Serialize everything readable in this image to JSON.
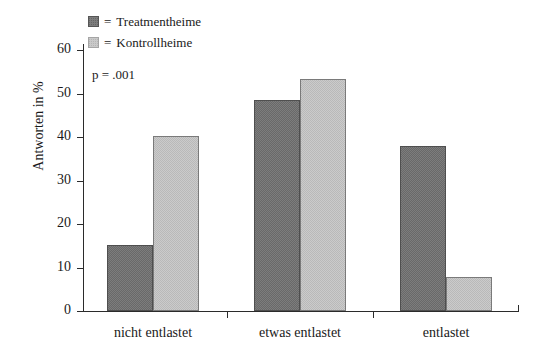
{
  "chart_data": {
    "type": "bar",
    "title": "",
    "xlabel": "",
    "ylabel": "Antworten in %",
    "ylim": [
      0,
      60
    ],
    "yticks": [
      0,
      10,
      20,
      30,
      40,
      50,
      60
    ],
    "grid": false,
    "legend_position": "top-left",
    "categories": [
      "nicht entlastet",
      "etwas entlastet",
      "entlastet"
    ],
    "series": [
      {
        "name": "Treatmentheime",
        "color": "#7d7d7d",
        "values": [
          15.1,
          48.5,
          37.9
        ]
      },
      {
        "name": "Kontrollheime",
        "color": "#cbcbcb",
        "values": [
          40.2,
          53.4,
          7.8
        ]
      }
    ],
    "annotations": [
      {
        "name": "p-value",
        "text": "p = .001"
      }
    ]
  },
  "legend": {
    "equals": "=",
    "items": [
      {
        "swatch": "dark-square-icon",
        "label": "Treatmentheime"
      },
      {
        "swatch": "light-square-icon",
        "label": "Kontrollheime"
      }
    ]
  },
  "axis": {
    "y_title": "Antworten in %",
    "y_tick_labels": [
      "60",
      "50",
      "40",
      "30",
      "20",
      "10",
      "0"
    ]
  },
  "note": {
    "p_value": "p = .001"
  }
}
